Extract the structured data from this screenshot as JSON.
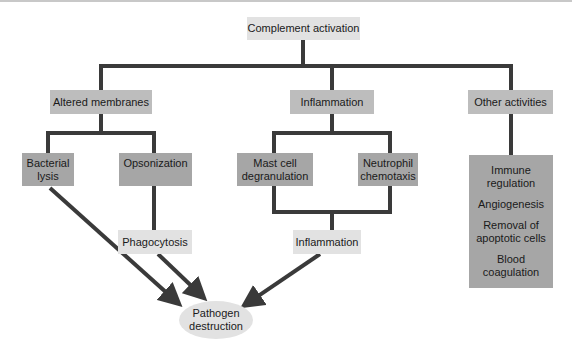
{
  "diagram": {
    "root": {
      "label": "Complement activation"
    },
    "level1": [
      {
        "label": "Altered membranes"
      },
      {
        "label": "Inflammation"
      },
      {
        "label": "Other activities"
      }
    ],
    "level2": {
      "bacterial_lysis": {
        "line1": "Bacterial",
        "line2": "lysis"
      },
      "opsonization": {
        "label": "Opsonization"
      },
      "mast_cell": {
        "line1": "Mast cell",
        "line2": "degranulation"
      },
      "neutrophil": {
        "line1": "Neutrophil",
        "line2": "chemotaxis"
      },
      "other_list": [
        {
          "line1": "Immune",
          "line2": "regulation"
        },
        {
          "line1": "Angiogenesis",
          "line2": ""
        },
        {
          "line1": "Removal of",
          "line2": "apoptotic cells"
        },
        {
          "line1": "Blood",
          "line2": "coagulation"
        }
      ]
    },
    "level3": {
      "phagocytosis": {
        "label": "Phagocytosis"
      },
      "inflammation_result": {
        "label": "Inflammation"
      }
    },
    "outcome": {
      "line1": "Pathogen",
      "line2": "destruction"
    },
    "colors": {
      "connector": "#3a3a3a",
      "light_box": "#e2e2e2",
      "mid_box": "#bdbdbd",
      "dark_box": "#a6a6a6"
    }
  }
}
